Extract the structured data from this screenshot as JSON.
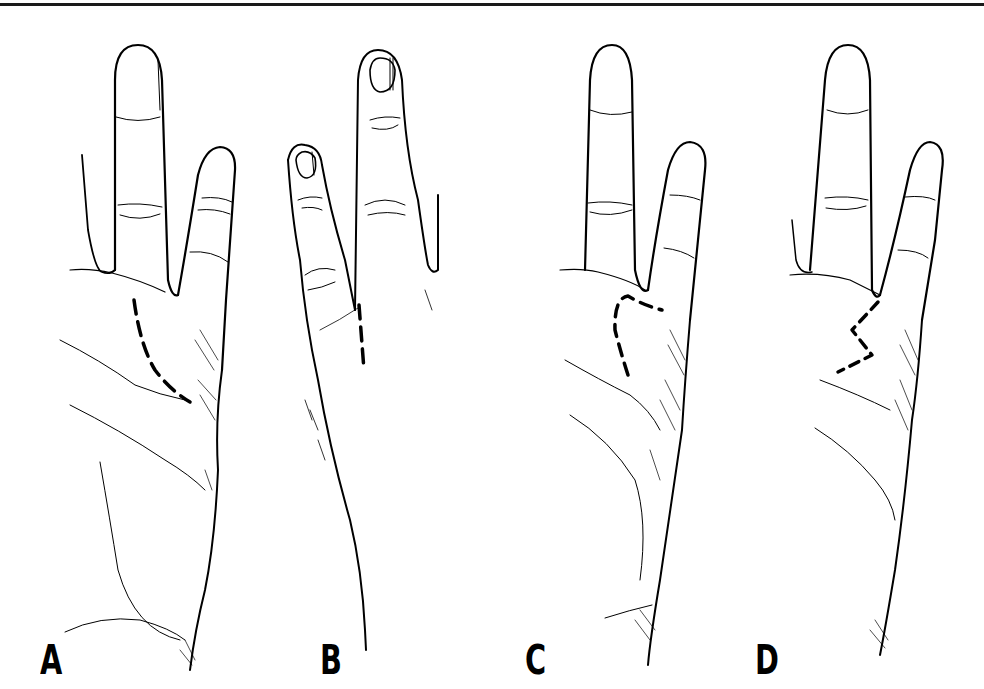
{
  "figure": {
    "ink_color": "#000000",
    "background": "#ffffff",
    "panels": [
      {
        "label": "A",
        "view": "palmar",
        "incision": "curved dashed line along thenar crease"
      },
      {
        "label": "B",
        "view": "dorsal",
        "incision": "straight dashed line at web space"
      },
      {
        "label": "C",
        "view": "palmar",
        "incision": "triangular flap dashed outline"
      },
      {
        "label": "D",
        "view": "palmar",
        "incision": "zigzag (Z-plasty) dashed line"
      }
    ]
  }
}
